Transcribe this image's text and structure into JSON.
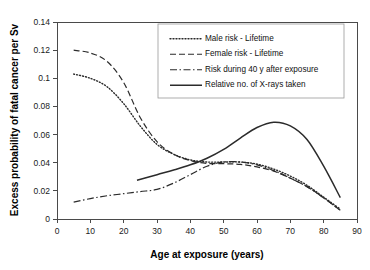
{
  "chart_data": {
    "type": "line",
    "title": "",
    "xlabel": "Age at exposure (years)",
    "ylabel": "Excess probability of fatal cancer per Sv",
    "xlim": [
      0,
      90
    ],
    "ylim": [
      0,
      0.14
    ],
    "grid": false,
    "legend_position": "top-right",
    "xticks": [
      "0",
      "10",
      "20",
      "30",
      "40",
      "50",
      "60",
      "70",
      "80",
      "90"
    ],
    "xtick_values": [
      0,
      10,
      20,
      30,
      40,
      50,
      60,
      70,
      80,
      90
    ],
    "yticks": [
      "0",
      "0.02",
      "0.04",
      "0.06",
      "0.08",
      "0.1",
      "0.12",
      "0.14"
    ],
    "ytick_values": [
      0,
      0.02,
      0.04,
      0.06,
      0.08,
      0.1,
      0.12,
      0.14
    ],
    "series": [
      {
        "name": "Male risk - Lifetime",
        "style": "dotted",
        "dasharray": "1,2",
        "width": 1.4,
        "x": [
          5,
          10,
          15,
          20,
          25,
          30,
          35,
          40,
          45,
          50,
          55,
          60,
          65,
          70,
          75,
          80,
          85
        ],
        "values": [
          0.103,
          0.1,
          0.094,
          0.082,
          0.066,
          0.053,
          0.046,
          0.042,
          0.0405,
          0.0405,
          0.0405,
          0.039,
          0.0355,
          0.0305,
          0.024,
          0.0155,
          0.007
        ]
      },
      {
        "name": "Female risk - Lifetime",
        "style": "dashed",
        "dasharray": "6,3",
        "width": 1.2,
        "x": [
          5,
          10,
          15,
          20,
          25,
          30,
          35,
          40,
          45,
          50,
          55,
          60,
          65,
          70,
          75,
          80,
          85
        ],
        "values": [
          0.12,
          0.118,
          0.112,
          0.097,
          0.072,
          0.055,
          0.046,
          0.0415,
          0.0395,
          0.0393,
          0.0388,
          0.037,
          0.034,
          0.029,
          0.023,
          0.015,
          0.0062
        ]
      },
      {
        "name": "Risk during 40 y after exposure",
        "style": "dash-dot",
        "dasharray": "7,2.5,1.5,2.5",
        "width": 1.2,
        "x": [
          5,
          10,
          15,
          20,
          25,
          30,
          35,
          40,
          45,
          50,
          55,
          60,
          65,
          70,
          75,
          80,
          85
        ],
        "values": [
          0.012,
          0.0145,
          0.0165,
          0.018,
          0.0195,
          0.021,
          0.0255,
          0.0315,
          0.0375,
          0.0405,
          0.0405,
          0.0385,
          0.0345,
          0.029,
          0.023,
          0.015,
          0.0062
        ]
      },
      {
        "name": "Relative no. of X-rays taken",
        "style": "solid",
        "dasharray": "",
        "width": 1.5,
        "x": [
          24,
          30,
          35,
          40,
          45,
          50,
          55,
          60,
          65,
          70,
          75,
          80,
          85
        ],
        "values": [
          0.0275,
          0.0315,
          0.0348,
          0.0385,
          0.0432,
          0.0495,
          0.0575,
          0.065,
          0.0688,
          0.0662,
          0.0565,
          0.0375,
          0.0152
        ]
      }
    ]
  },
  "plot": {
    "origin_x": 57,
    "origin_y": 219,
    "right_x": 357,
    "top_y": 22
  },
  "legend": {
    "x": 158,
    "y": 24,
    "width": 186,
    "height": 74
  }
}
